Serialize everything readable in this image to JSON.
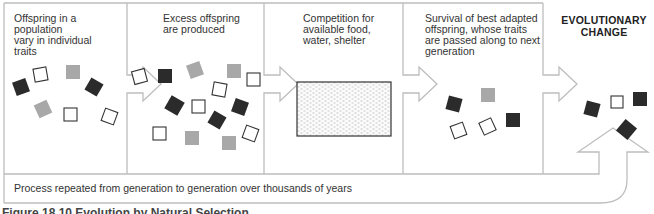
{
  "diagram": {
    "type": "flow-diagram",
    "subject": "Evolution by natural selection",
    "colors": {
      "outline": "#bdbdbd",
      "dark_square": "#2b2b2b",
      "gray_square": "#a8a8a8",
      "hollow_square_stroke": "#333333",
      "text": "#333333"
    },
    "panels": [
      {
        "id": "variation",
        "label": "Offspring in a population vary in individual traits",
        "lines": [
          "Offspring in a population",
          "vary in individual",
          "traits"
        ]
      },
      {
        "id": "overproduction",
        "label": "Excess offspring are produced",
        "lines": [
          "Excess offspring",
          "are produced"
        ]
      },
      {
        "id": "competition",
        "label": "Competition for available food, water, shelter",
        "lines": [
          "Competition for",
          "available food,",
          "water, shelter"
        ]
      },
      {
        "id": "survival",
        "label": "Survival of best adapted offspring, whose traits are passed along to next generation",
        "lines": [
          "Survival of best adapted",
          "offspring, whose traits",
          "are passed along to next",
          "generation"
        ]
      }
    ],
    "result": {
      "label": "EVOLUTIONARY CHANGE",
      "lines": [
        "EVOLUTIONARY",
        "CHANGE"
      ]
    },
    "feedback_loop": {
      "label": "Process repeated from generation to generation over thousands of years"
    },
    "caption": "Figure 18.10  Evolution by Natural Selection",
    "squares": {
      "panel1": [
        {
          "x": 14,
          "y": 80,
          "s": 14,
          "r": -20,
          "kind": "dark"
        },
        {
          "x": 34,
          "y": 68,
          "s": 13,
          "r": -10,
          "kind": "hollow"
        },
        {
          "x": 66,
          "y": 65,
          "s": 14,
          "r": 0,
          "kind": "gray"
        },
        {
          "x": 87,
          "y": 80,
          "s": 14,
          "r": 30,
          "kind": "dark"
        },
        {
          "x": 36,
          "y": 102,
          "s": 14,
          "r": -25,
          "kind": "gray"
        },
        {
          "x": 64,
          "y": 108,
          "s": 13,
          "r": 0,
          "kind": "hollow"
        },
        {
          "x": 103,
          "y": 110,
          "s": 13,
          "r": 20,
          "kind": "hollow"
        }
      ],
      "panel2": [
        {
          "x": 133,
          "y": 70,
          "s": 13,
          "r": -15,
          "kind": "hollow"
        },
        {
          "x": 158,
          "y": 69,
          "s": 14,
          "r": 0,
          "kind": "dark"
        },
        {
          "x": 188,
          "y": 63,
          "s": 14,
          "r": -20,
          "kind": "gray"
        },
        {
          "x": 227,
          "y": 64,
          "s": 14,
          "r": 0,
          "kind": "gray"
        },
        {
          "x": 247,
          "y": 73,
          "s": 13,
          "r": 0,
          "kind": "hollow"
        },
        {
          "x": 213,
          "y": 83,
          "s": 13,
          "r": 10,
          "kind": "hollow"
        },
        {
          "x": 167,
          "y": 98,
          "s": 15,
          "r": 30,
          "kind": "dark"
        },
        {
          "x": 192,
          "y": 100,
          "s": 13,
          "r": 0,
          "kind": "hollow"
        },
        {
          "x": 233,
          "y": 100,
          "s": 14,
          "r": 20,
          "kind": "dark"
        },
        {
          "x": 210,
          "y": 113,
          "s": 14,
          "r": 30,
          "kind": "dark"
        },
        {
          "x": 244,
          "y": 127,
          "s": 13,
          "r": 20,
          "kind": "hollow"
        },
        {
          "x": 153,
          "y": 127,
          "s": 13,
          "r": 0,
          "kind": "hollow"
        },
        {
          "x": 185,
          "y": 131,
          "s": 14,
          "r": 0,
          "kind": "gray"
        },
        {
          "x": 222,
          "y": 136,
          "s": 14,
          "r": 0,
          "kind": "gray"
        }
      ],
      "panel4": [
        {
          "x": 447,
          "y": 97,
          "s": 14,
          "r": 15,
          "kind": "dark"
        },
        {
          "x": 481,
          "y": 88,
          "s": 14,
          "r": 0,
          "kind": "gray"
        },
        {
          "x": 452,
          "y": 124,
          "s": 13,
          "r": -20,
          "kind": "hollow"
        },
        {
          "x": 481,
          "y": 120,
          "s": 13,
          "r": -25,
          "kind": "hollow"
        },
        {
          "x": 506,
          "y": 113,
          "s": 14,
          "r": 0,
          "kind": "dark"
        }
      ],
      "result": [
        {
          "x": 585,
          "y": 102,
          "s": 14,
          "r": 15,
          "kind": "dark"
        },
        {
          "x": 611,
          "y": 96,
          "s": 12,
          "r": 0,
          "kind": "hollow"
        },
        {
          "x": 633,
          "y": 92,
          "s": 14,
          "r": 0,
          "kind": "dark"
        },
        {
          "x": 619,
          "y": 122,
          "s": 15,
          "r": 40,
          "kind": "dark"
        }
      ]
    }
  }
}
